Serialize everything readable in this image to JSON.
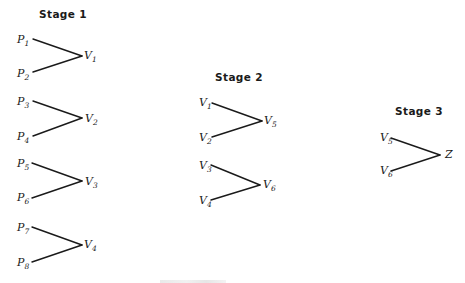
{
  "figure": {
    "stages": [
      {
        "title": "Stage 1",
        "title_pos": [
          39,
          9
        ],
        "groups": [
          {
            "inputs": [
              {
                "base": "P",
                "sub": "1",
                "pos": [
                  17,
                  34
                ],
                "line_start": [
                  33,
                  39
                ]
              },
              {
                "base": "P",
                "sub": "2",
                "pos": [
                  17,
                  68
                ],
                "line_start": [
                  33,
                  72
                ]
              }
            ],
            "output": {
              "base": "V",
              "sub": "1",
              "pos": [
                84,
                50
              ],
              "apex": [
                82,
                56
              ]
            }
          },
          {
            "inputs": [
              {
                "base": "P",
                "sub": "3",
                "pos": [
                  17,
                  96
                ],
                "line_start": [
                  33,
                  101
                ]
              },
              {
                "base": "P",
                "sub": "4",
                "pos": [
                  17,
                  131
                ],
                "line_start": [
                  33,
                  136
                ]
              }
            ],
            "output": {
              "base": "V",
              "sub": "2",
              "pos": [
                85,
                113
              ],
              "apex": [
                82,
                118
              ]
            }
          },
          {
            "inputs": [
              {
                "base": "P",
                "sub": "5",
                "pos": [
                  17,
                  158
                ],
                "line_start": [
                  32,
                  163
                ]
              },
              {
                "base": "P",
                "sub": "6",
                "pos": [
                  17,
                  192
                ],
                "line_start": [
                  32,
                  198
                ]
              }
            ],
            "output": {
              "base": "V",
              "sub": "3",
              "pos": [
                85,
                176
              ],
              "apex": [
                82,
                181
              ]
            }
          },
          {
            "inputs": [
              {
                "base": "P",
                "sub": "7",
                "pos": [
                  17,
                  222
                ],
                "line_start": [
                  32,
                  227
                ]
              },
              {
                "base": "P",
                "sub": "8",
                "pos": [
                  17,
                  257
                ],
                "line_start": [
                  32,
                  262
                ]
              }
            ],
            "output": {
              "base": "V",
              "sub": "4",
              "pos": [
                84,
                239
              ],
              "apex": [
                82,
                245
              ]
            }
          }
        ]
      },
      {
        "title": "Stage 2",
        "title_pos": [
          215,
          72
        ],
        "groups": [
          {
            "inputs": [
              {
                "base": "V",
                "sub": "1",
                "pos": [
                  199,
                  97
                ],
                "line_start": [
                  212,
                  103
                ]
              },
              {
                "base": "V",
                "sub": "2",
                "pos": [
                  199,
                  132
                ],
                "line_start": [
                  212,
                  137
                ]
              }
            ],
            "output": {
              "base": "V",
              "sub": "5",
              "pos": [
                264,
                115
              ],
              "apex": [
                262,
                121
              ]
            }
          },
          {
            "inputs": [
              {
                "base": "V",
                "sub": "3",
                "pos": [
                  199,
                  160
                ],
                "line_start": [
                  211,
                  165
                ]
              },
              {
                "base": "V",
                "sub": "4",
                "pos": [
                  199,
                  195
                ],
                "line_start": [
                  211,
                  200
                ]
              }
            ],
            "output": {
              "base": "V",
              "sub": "6",
              "pos": [
                263,
                179
              ],
              "apex": [
                260,
                185
              ]
            }
          }
        ]
      },
      {
        "title": "Stage 3",
        "title_pos": [
          395,
          106
        ],
        "groups": [
          {
            "inputs": [
              {
                "base": "V",
                "sub": "5",
                "pos": [
                  380,
                  132
                ],
                "line_start": [
                  391,
                  138
                ]
              },
              {
                "base": "V",
                "sub": "6",
                "pos": [
                  380,
                  165
                ],
                "line_start": [
                  391,
                  171
                ]
              }
            ],
            "output": {
              "base": "Z",
              "sub": "",
              "pos": [
                445,
                149
              ],
              "apex": [
                440,
                155
              ]
            }
          }
        ]
      }
    ],
    "line_color": "#1a1a1a",
    "text_color": "#1a1a1a",
    "background": "#ffffff"
  }
}
